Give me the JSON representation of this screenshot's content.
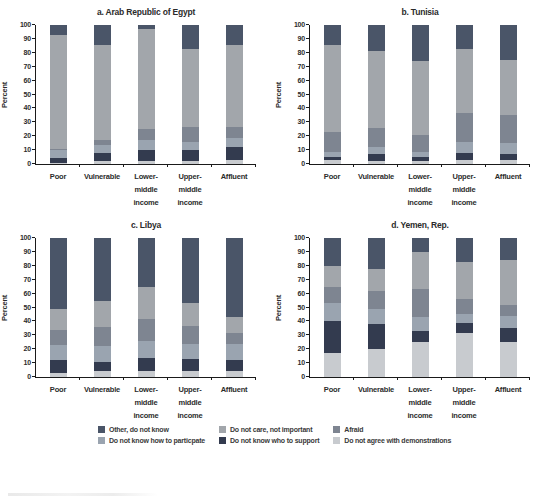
{
  "legend": {
    "items": [
      {
        "label": "Other, do not know",
        "color": "#4a5568"
      },
      {
        "label": "Do not care, not important",
        "color": "#a2a6ab"
      },
      {
        "label": "Afraid",
        "color": "#7e8591"
      },
      {
        "label": "Do not know how to particpate",
        "color": "#9aa4b0"
      },
      {
        "label": "Do not know who to support",
        "color": "#333b4f"
      },
      {
        "label": "Do not agree with demonstrations",
        "color": "#c8cbcf"
      }
    ]
  },
  "axis": {
    "ylabel": "Percent",
    "ylim": [
      0,
      100
    ],
    "yticks": [
      0,
      10,
      20,
      30,
      40,
      50,
      60,
      70,
      80,
      90,
      100
    ],
    "categories": [
      {
        "label": "Poor",
        "lines": [
          "Poor"
        ]
      },
      {
        "label": "Vulnerable",
        "lines": [
          "Vulnerable"
        ]
      },
      {
        "label": "Lower-middle income",
        "lines": [
          "Lower-",
          "middle",
          "income"
        ]
      },
      {
        "label": "Upper-middle income",
        "lines": [
          "Upper-",
          "middle",
          "income"
        ]
      },
      {
        "label": "Affluent",
        "lines": [
          "Affluent"
        ]
      }
    ]
  },
  "chart_data": [
    {
      "type": "bar",
      "stacked": true,
      "stack_order": "bottom_to_top",
      "title": "a. Arab Republic of Egypt",
      "xlabel": "",
      "ylabel": "Percent",
      "ylim": [
        0,
        100
      ],
      "categories": [
        "Poor",
        "Vulnerable",
        "Lower-middle income",
        "Upper-middle income",
        "Affluent"
      ],
      "series": [
        {
          "name": "Do not agree with demonstrations",
          "color": "#c8cbcf",
          "values": [
            1,
            2,
            2,
            2,
            3
          ]
        },
        {
          "name": "Do not know who to support",
          "color": "#333b4f",
          "values": [
            3,
            6,
            8,
            8,
            9
          ]
        },
        {
          "name": "Do not know how to particpate",
          "color": "#9aa4b0",
          "values": [
            6,
            6,
            7,
            6,
            7
          ]
        },
        {
          "name": "Afraid",
          "color": "#7e8591",
          "values": [
            1,
            3,
            8,
            11,
            8
          ]
        },
        {
          "name": "Do not care, not important",
          "color": "#a2a6ab",
          "values": [
            82,
            69,
            72,
            56,
            59
          ]
        },
        {
          "name": "Other, do not know",
          "color": "#4a5568",
          "values": [
            7,
            14,
            3,
            17,
            14
          ]
        }
      ]
    },
    {
      "type": "bar",
      "stacked": true,
      "stack_order": "bottom_to_top",
      "title": "b. Tunisia",
      "xlabel": "",
      "ylabel": "Percent",
      "ylim": [
        0,
        100
      ],
      "categories": [
        "Poor",
        "Vulnerable",
        "Lower-middle income",
        "Upper-middle income",
        "Affluent"
      ],
      "series": [
        {
          "name": "Do not agree with demonstrations",
          "color": "#c8cbcf",
          "values": [
            3,
            2,
            2,
            3,
            3
          ]
        },
        {
          "name": "Do not know who to support",
          "color": "#333b4f",
          "values": [
            2,
            5,
            3,
            5,
            4
          ]
        },
        {
          "name": "Do not know how to particpate",
          "color": "#9aa4b0",
          "values": [
            4,
            5,
            4,
            8,
            8
          ]
        },
        {
          "name": "Afraid",
          "color": "#7e8591",
          "values": [
            14,
            14,
            12,
            21,
            20
          ]
        },
        {
          "name": "Do not care, not important",
          "color": "#a2a6ab",
          "values": [
            63,
            55,
            53,
            46,
            40
          ]
        },
        {
          "name": "Other, do not know",
          "color": "#4a5568",
          "values": [
            14,
            19,
            26,
            17,
            25
          ]
        }
      ]
    },
    {
      "type": "bar",
      "stacked": true,
      "stack_order": "bottom_to_top",
      "title": "c. Libya",
      "xlabel": "",
      "ylabel": "Percent",
      "ylim": [
        0,
        100
      ],
      "categories": [
        "Poor",
        "Vulnerable",
        "Lower-middle income",
        "Upper-middle income",
        "Affluent"
      ],
      "series": [
        {
          "name": "Do not agree with demonstrations",
          "color": "#c8cbcf",
          "values": [
            3,
            4,
            4,
            4,
            4
          ]
        },
        {
          "name": "Do not know who to support",
          "color": "#333b4f",
          "values": [
            9,
            7,
            10,
            9,
            8
          ]
        },
        {
          "name": "Do not know how to particpate",
          "color": "#9aa4b0",
          "values": [
            11,
            11,
            12,
            11,
            12
          ]
        },
        {
          "name": "Afraid",
          "color": "#7e8591",
          "values": [
            11,
            14,
            16,
            13,
            8
          ]
        },
        {
          "name": "Do not care, not important",
          "color": "#a2a6ab",
          "values": [
            15,
            19,
            23,
            16,
            11
          ]
        },
        {
          "name": "Other, do not know",
          "color": "#4a5568",
          "values": [
            51,
            45,
            35,
            47,
            57
          ]
        }
      ]
    },
    {
      "type": "bar",
      "stacked": true,
      "stack_order": "bottom_to_top",
      "title": "d. Yemen, Rep.",
      "xlabel": "",
      "ylabel": "Percent",
      "ylim": [
        0,
        100
      ],
      "categories": [
        "Poor",
        "Vulnerable",
        "Lower-middle income",
        "Upper-middle income",
        "Affluent"
      ],
      "series": [
        {
          "name": "Do not agree with demonstrations",
          "color": "#c8cbcf",
          "values": [
            17,
            20,
            25,
            32,
            25
          ]
        },
        {
          "name": "Do not know who to support",
          "color": "#333b4f",
          "values": [
            23,
            18,
            8,
            7,
            10
          ]
        },
        {
          "name": "Do not know how to particpate",
          "color": "#9aa4b0",
          "values": [
            13,
            11,
            10,
            6,
            9
          ]
        },
        {
          "name": "Afraid",
          "color": "#7e8591",
          "values": [
            12,
            13,
            20,
            11,
            8
          ]
        },
        {
          "name": "Do not care, not important",
          "color": "#a2a6ab",
          "values": [
            15,
            16,
            27,
            27,
            32
          ]
        },
        {
          "name": "Other, do not know",
          "color": "#4a5568",
          "values": [
            20,
            22,
            10,
            17,
            16
          ]
        }
      ]
    }
  ]
}
